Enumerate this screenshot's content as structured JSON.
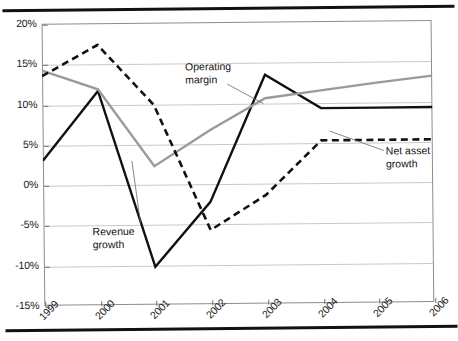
{
  "figure": {
    "top_rule": "rule",
    "bottom_rule": "rule"
  },
  "chart_data": {
    "type": "line",
    "title": "",
    "xlabel": "",
    "ylabel": "",
    "categories": [
      "1999",
      "2000",
      "2001",
      "2002",
      "2003",
      "2004",
      "2005",
      "2006"
    ],
    "ylim": [
      -15,
      20
    ],
    "ytick_labels": [
      "20%",
      "15%",
      "10%",
      "5%",
      "0%",
      "-5%",
      "-10%",
      "-15%"
    ],
    "ytick_values": [
      20,
      15,
      10,
      5,
      0,
      -5,
      -10,
      -15
    ],
    "grid": true,
    "legend": "annotated-labels",
    "series": [
      {
        "name": "Revenue growth",
        "style": "solid",
        "color": "#111111",
        "width": 2.4,
        "values": [
          3.0,
          11.6,
          -10.3,
          -2.3,
          13.4,
          9.2,
          9.2,
          9.2
        ]
      },
      {
        "name": "Operating margin",
        "style": "solid",
        "color": "#9a9a9a",
        "width": 2.4,
        "values": [
          14.2,
          11.8,
          2.2,
          6.6,
          10.5,
          11.4,
          12.3,
          13.1
        ]
      },
      {
        "name": "Net asset growth",
        "style": "dashed",
        "color": "#111111",
        "width": 2.6,
        "values": [
          13.5,
          17.3,
          9.8,
          -5.8,
          -1.5,
          5.2,
          5.2,
          5.2
        ]
      }
    ],
    "annotations": [
      {
        "id": "operating-margin",
        "text": "Operating\nmargin",
        "target_series": "Operating margin"
      },
      {
        "id": "revenue-growth",
        "text": "Revenue\ngrowth",
        "target_series": "Revenue growth"
      },
      {
        "id": "net-asset-growth",
        "text": "Net asset\ngrowth",
        "target_series": "Net asset growth"
      }
    ]
  }
}
